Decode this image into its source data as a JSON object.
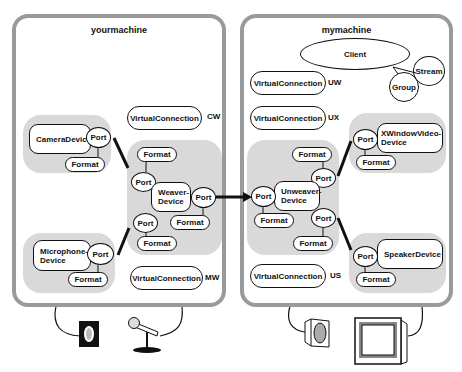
{
  "yourmachine": {
    "title": "yourmachine",
    "camera_device": "CameraDevice",
    "camera_port": "Port",
    "camera_format": "Format",
    "microphone_device": "Microphone-\nDevice",
    "microphone_port": "Port",
    "microphone_format": "Format",
    "weaver_device": "Weaver-\nDevice",
    "weaver_port_top": "Port",
    "weaver_format_top": "Format",
    "weaver_port_right": "Port",
    "weaver_format_right": "Format",
    "weaver_port_bottom": "Port",
    "weaver_format_bottom": "Format",
    "vc_cw": "VirtualConnection",
    "vc_cw_label": "CW",
    "vc_mw": "VirtualConnection",
    "vc_mw_label": "MW"
  },
  "mymachine": {
    "title": "mymachine",
    "client": "Client",
    "stream": "Stream",
    "group": "Group",
    "vc_uw": "VirtualConnection",
    "vc_uw_label": "UW",
    "vc_ux": "VirtualConnection",
    "vc_ux_label": "UX",
    "vc_us": "VirtualConnection",
    "vc_us_label": "US",
    "unweaver_device": "Unweaver-\nDevice",
    "unweaver_port_left": "Port",
    "unweaver_format_left": "Format",
    "unweaver_port_top": "Port",
    "unweaver_format_top": "Format",
    "unweaver_port_bottom": "Port",
    "unweaver_format_bottom": "Format",
    "xwindow_device": "XWindowVideo-\nDevice",
    "xwindow_port": "Port",
    "xwindow_format": "Format",
    "speaker_device": "SpeakerDevice",
    "speaker_port": "Port",
    "speaker_format": "Format"
  },
  "hardware_icons": [
    "camera-icon",
    "microphone-icon",
    "speaker-icon",
    "monitor-icon"
  ],
  "colors": {
    "machine_border": "#9a9a9a",
    "cluster_fill": "#d9d9d9",
    "line": "#111111"
  }
}
